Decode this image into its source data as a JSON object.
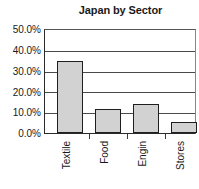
{
  "chart_data": {
    "type": "bar",
    "title": "Japan by Sector",
    "xlabel": "",
    "ylabel": "",
    "categories": [
      "Textile",
      "Food",
      "Engin",
      "Stores"
    ],
    "values": [
      35.0,
      11.5,
      14.0,
      5.5
    ],
    "value_labels": [
      "35.0%",
      "11.5%",
      "14.0%",
      "5.5%"
    ],
    "ylim": [
      0,
      50
    ],
    "ytick_values": [
      0,
      10,
      20,
      30,
      40,
      50
    ],
    "ytick_labels": [
      "0.0%",
      "10.0%",
      "20.0%",
      "30.0%",
      "40.0%",
      "50.0%"
    ],
    "grid": true,
    "grid_axis": "y",
    "legend": false,
    "legend_position": "none",
    "bar_fill_color": "#d2d2d2",
    "bar_edge_color": "#1f1f1f",
    "axis_color": "#2b2b2b",
    "background_color": "#ffffff",
    "label_rotation": -90
  }
}
